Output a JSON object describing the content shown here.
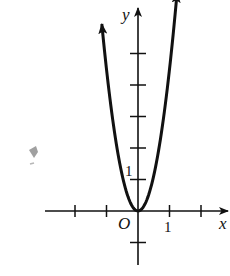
{
  "figure": {
    "axes": {
      "x_label": "x",
      "y_label": "y",
      "origin_label": "O",
      "x_tick_label": "1",
      "y_tick_label": "1",
      "x_ticks": [
        -2,
        -1,
        1,
        2
      ],
      "y_ticks": [
        -1,
        1,
        2,
        3,
        4,
        5
      ],
      "x_range": [
        -3,
        3
      ],
      "y_range": [
        -1.7,
        6.4
      ]
    },
    "curve": {
      "type": "parabola",
      "vertex": [
        0,
        0
      ],
      "coefficient": 4.5,
      "x_extent": [
        -1.15,
        1.3
      ],
      "arrows_at_ends": true
    },
    "colors": {
      "stroke": "#111111",
      "background": "#ffffff",
      "smudge": "#555555"
    }
  }
}
